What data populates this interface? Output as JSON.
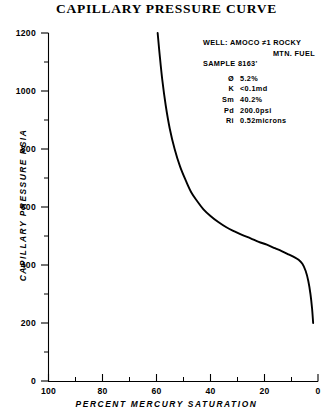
{
  "chart_data": {
    "type": "line",
    "title": "CAPILLARY PRESSURE CURVE",
    "xlabel": "PERCENT MERCURY SATURATION",
    "ylabel": "CAPILLARY PRESSURE  PSIA",
    "xlim": [
      100,
      0
    ],
    "ylim": [
      0,
      1200
    ],
    "x_reversed": true,
    "grid": false,
    "legend": null,
    "xticks": [
      100,
      80,
      60,
      40,
      20,
      0
    ],
    "xtick_labels": [
      "100",
      "80",
      "60",
      "40",
      "20",
      "0"
    ],
    "x_minor_step": 10,
    "yticks": [
      0,
      200,
      400,
      600,
      800,
      1000,
      1200
    ],
    "ytick_labels": [
      "0",
      "200",
      "400",
      "600",
      "800",
      "1000",
      "1200"
    ],
    "y_minor_step": 100,
    "series": [
      {
        "name": "capillary pressure",
        "line_color": "#000000",
        "x": [
          59.5,
          58.8,
          57.8,
          56.5,
          55.0,
          53.2,
          51.2,
          49.0,
          47.0,
          44.8,
          42.5,
          40.0,
          37.0,
          34.0,
          31.0,
          28.0,
          25.0,
          22.0,
          19.0,
          16.0,
          13.5,
          11.0,
          9.0,
          7.2,
          5.8,
          4.6,
          3.6,
          2.8,
          2.2,
          1.8
        ],
        "y": [
          1200,
          1130,
          1040,
          950,
          870,
          800,
          740,
          690,
          650,
          620,
          592,
          570,
          548,
          530,
          516,
          503,
          492,
          480,
          470,
          458,
          448,
          437,
          428,
          418,
          404,
          380,
          345,
          300,
          250,
          200
        ]
      }
    ],
    "annotations": {
      "well_label": "WELL:",
      "well_name": "AMOCO ≠1 ROCKY",
      "well_name_cont": "MTN. FUEL",
      "sample": "SAMPLE 8163'",
      "parameters": [
        {
          "symbol": "Ø",
          "value": "5.2%"
        },
        {
          "symbol": "K",
          "value": "<0.1md"
        },
        {
          "symbol": "Sm",
          "value": "40.2%"
        },
        {
          "symbol": "Pd",
          "value": "200.0psi"
        },
        {
          "symbol": "Ri",
          "value": "0.52microns"
        }
      ]
    },
    "colors": {
      "axis": "#000000",
      "curve": "#000000",
      "background": "#ffffff"
    }
  }
}
